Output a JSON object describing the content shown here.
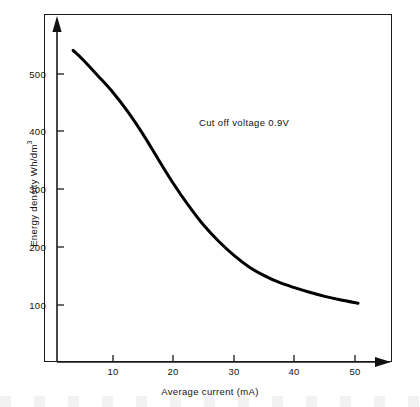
{
  "chart_data": {
    "type": "line",
    "title": "",
    "subtitle": "",
    "xlabel": "Average current  (mA)",
    "ylabel": "Energy density Wh/dm",
    "ylabel_exponent": "3",
    "xlim": [
      0,
      57
    ],
    "ylim": [
      0,
      580
    ],
    "xticks": [
      10,
      20,
      30,
      40,
      50
    ],
    "xtick_labels": [
      "10",
      "20",
      "30",
      "40",
      "50"
    ],
    "yticks": [
      100,
      200,
      300,
      400,
      500
    ],
    "ytick_labels": [
      "100",
      "200",
      "300",
      "400",
      "500"
    ],
    "grid": false,
    "legend": null,
    "annotations": [
      {
        "text": "Cut off voltage 0.9V",
        "x": 27,
        "y": 425
      }
    ],
    "series": [
      {
        "name": "Energy density vs average current",
        "color": "#000000",
        "line_width": 3,
        "x": [
          3.4,
          5,
          7.5,
          10,
          12.5,
          15,
          17.5,
          20,
          22.5,
          25,
          27.5,
          30,
          32.5,
          35,
          37.5,
          40,
          42.5,
          45,
          47.5,
          50.5
        ],
        "y": [
          541,
          525,
          497,
          468,
          434,
          395,
          352,
          310,
          272,
          238,
          210,
          186,
          166,
          151,
          139,
          130,
          122,
          115,
          109,
          103
        ]
      }
    ]
  },
  "axis_decorations": {
    "y_axis_arrow": "arrow-up",
    "x_axis_arrow": "arrow-right"
  }
}
